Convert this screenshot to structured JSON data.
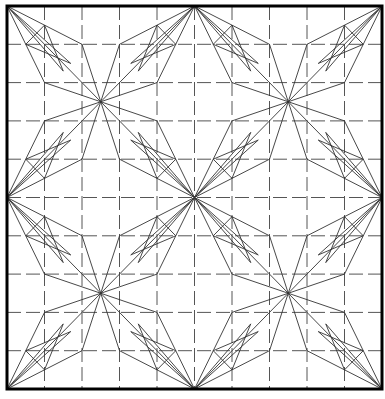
{
  "diagram": {
    "title": "",
    "frame": {
      "x0": 7,
      "y0": 6,
      "x1": 382,
      "y1": 389,
      "stroke": "#000000",
      "width": 3
    },
    "grid": {
      "divisions": 10,
      "stroke": "#555555",
      "dash": "14,5",
      "width": 1
    },
    "pattern": {
      "stroke": "#333333",
      "width": 0.9,
      "quadrant_units": 5,
      "segments": [
        [
          0,
          0,
          5,
          5
        ],
        [
          5,
          0,
          0,
          5
        ],
        [
          0,
          0,
          2,
          1
        ],
        [
          2,
          1,
          2.5,
          2.5
        ],
        [
          0,
          0,
          1,
          2
        ],
        [
          1,
          2,
          2.5,
          2.5
        ],
        [
          0,
          0,
          1.7,
          1.5
        ],
        [
          0,
          0,
          1.5,
          1.7
        ],
        [
          5,
          0,
          3,
          1
        ],
        [
          3,
          1,
          2.5,
          2.5
        ],
        [
          5,
          0,
          4,
          2
        ],
        [
          4,
          2,
          2.5,
          2.5
        ],
        [
          5,
          0,
          3.3,
          1.5
        ],
        [
          5,
          0,
          3.5,
          1.7
        ],
        [
          0,
          5,
          1,
          3
        ],
        [
          1,
          3,
          2.5,
          2.5
        ],
        [
          0,
          5,
          2,
          4
        ],
        [
          2,
          4,
          2.5,
          2.5
        ],
        [
          0,
          5,
          1.5,
          3.3
        ],
        [
          0,
          5,
          1.7,
          3.5
        ],
        [
          5,
          5,
          4,
          3
        ],
        [
          4,
          3,
          2.5,
          2.5
        ],
        [
          5,
          5,
          3,
          4
        ],
        [
          3,
          4,
          2.5,
          2.5
        ],
        [
          5,
          5,
          3.5,
          3.3
        ],
        [
          5,
          5,
          3.3,
          3.5
        ],
        [
          1,
          0.5,
          0.5,
          1
        ],
        [
          0.5,
          1,
          1.7,
          1.5
        ],
        [
          1,
          0.5,
          1.5,
          1.7
        ],
        [
          4,
          0.5,
          4.5,
          1
        ],
        [
          4.5,
          1,
          3.3,
          1.5
        ],
        [
          4,
          0.5,
          3.5,
          1.7
        ],
        [
          1,
          4.5,
          0.5,
          4
        ],
        [
          0.5,
          4,
          1.7,
          3.5
        ],
        [
          1,
          4.5,
          1.5,
          3.3
        ],
        [
          4,
          4.5,
          4.5,
          4
        ],
        [
          4.5,
          4,
          3.3,
          3.5
        ],
        [
          4,
          4.5,
          3.5,
          3.3
        ]
      ]
    }
  }
}
